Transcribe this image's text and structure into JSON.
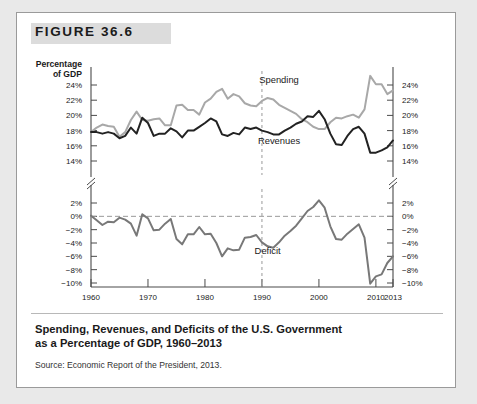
{
  "figure": {
    "label": "FIGURE 36.6",
    "caption_line1": "Spending, Revenues, and Deficits of the U.S. Government",
    "caption_line2": "as a Percentage of GDP, 1960–2013",
    "source": "Source: Economic Report of the President, 2013."
  },
  "colors": {
    "page_background": "#e9e9e9",
    "card_background": "#ffffff",
    "band": "#dcdcdc",
    "axis": "#4a4a4a",
    "spending_line": "#a8a8a8",
    "revenues_line": "#222222",
    "deficit_line": "#787878",
    "dashed_guide": "#999999",
    "text": "#1a1a1a"
  },
  "chart_data": {
    "type": "line",
    "title": "Spending, Revenues, and Deficits of the U.S. Government as a Percentage of GDP, 1960–2013",
    "xlabel": "Year",
    "ylabel": "Percentage of GDP",
    "xlim": [
      1960,
      2013
    ],
    "grid": false,
    "legend": "inline-labels",
    "axis_break": true,
    "x_ticks": [
      1960,
      1970,
      1980,
      1990,
      2000,
      2010,
      2013
    ],
    "upper_panel": {
      "ylabel_left": "Percentage of GDP",
      "y_ticks": [
        "24%",
        "22%",
        "20%",
        "18%",
        "16%",
        "14%"
      ],
      "y_tick_values": [
        24,
        22,
        20,
        18,
        16,
        14
      ],
      "ylim": [
        13,
        25
      ]
    },
    "lower_panel": {
      "y_ticks": [
        "2%",
        "0%",
        "−2%",
        "−4%",
        "−6%",
        "−8%",
        "−10%"
      ],
      "y_tick_values": [
        2,
        0,
        -2,
        -4,
        -6,
        -8,
        -10
      ],
      "ylim": [
        -11,
        3
      ]
    },
    "annotations": [
      {
        "text": "Spending",
        "x": 1993,
        "y": 24.3
      },
      {
        "text": "Revenues",
        "x": 1993,
        "y": 16.2
      },
      {
        "text": "Deficit",
        "x": 1991,
        "y": -5.6
      },
      {
        "text": "Year",
        "x": 2011,
        "y": null
      }
    ],
    "x": [
      1960,
      1961,
      1962,
      1963,
      1964,
      1965,
      1966,
      1967,
      1968,
      1969,
      1970,
      1971,
      1972,
      1973,
      1974,
      1975,
      1976,
      1977,
      1978,
      1979,
      1980,
      1981,
      1982,
      1983,
      1984,
      1985,
      1986,
      1987,
      1988,
      1989,
      1990,
      1991,
      1992,
      1993,
      1994,
      1995,
      1996,
      1997,
      1998,
      1999,
      2000,
      2001,
      2002,
      2003,
      2004,
      2005,
      2006,
      2007,
      2008,
      2009,
      2010,
      2011,
      2012,
      2013
    ],
    "series": [
      {
        "name": "Spending",
        "color": "#a8a8a8",
        "panel": "upper",
        "values": [
          17.8,
          18.4,
          18.8,
          18.6,
          18.5,
          17.2,
          17.8,
          19.4,
          20.5,
          19.4,
          19.3,
          19.5,
          19.6,
          18.7,
          18.7,
          21.3,
          21.4,
          20.7,
          20.7,
          20.1,
          21.7,
          22.2,
          23.1,
          23.5,
          22.2,
          22.8,
          22.5,
          21.6,
          21.3,
          21.2,
          21.9,
          22.3,
          22.1,
          21.4,
          21.0,
          20.6,
          20.2,
          19.5,
          19.1,
          18.5,
          18.2,
          18.2,
          19.1,
          19.7,
          19.6,
          19.9,
          20.1,
          19.7,
          20.8,
          25.2,
          24.1,
          24.1,
          22.8,
          23.3
        ]
      },
      {
        "name": "Revenues",
        "color": "#222222",
        "panel": "upper",
        "values": [
          17.8,
          17.8,
          17.6,
          17.8,
          17.6,
          17.0,
          17.3,
          18.4,
          17.6,
          19.7,
          19.0,
          17.3,
          17.6,
          17.6,
          18.3,
          17.9,
          17.1,
          18.0,
          18.0,
          18.5,
          19.0,
          19.6,
          19.2,
          17.5,
          17.3,
          17.7,
          17.5,
          18.4,
          18.2,
          18.4,
          18.0,
          17.8,
          17.5,
          17.5,
          18.0,
          18.4,
          18.9,
          19.2,
          19.9,
          19.8,
          20.6,
          19.5,
          17.6,
          16.2,
          16.1,
          17.3,
          18.2,
          18.5,
          17.6,
          15.1,
          15.1,
          15.4,
          15.8,
          16.7
        ]
      },
      {
        "name": "Deficit",
        "color": "#787878",
        "panel": "lower",
        "values": [
          0.1,
          -0.6,
          -1.3,
          -0.8,
          -0.9,
          -0.2,
          -0.5,
          -1.1,
          -2.9,
          0.3,
          -0.3,
          -2.1,
          -2.0,
          -1.1,
          -0.4,
          -3.4,
          -4.2,
          -2.7,
          -2.7,
          -1.6,
          -2.7,
          -2.6,
          -4.0,
          -6.0,
          -4.8,
          -5.1,
          -5.0,
          -3.2,
          -3.1,
          -2.8,
          -3.9,
          -4.5,
          -4.7,
          -3.9,
          -2.9,
          -2.2,
          -1.4,
          -0.3,
          0.8,
          1.4,
          2.4,
          1.3,
          -1.5,
          -3.4,
          -3.5,
          -2.6,
          -1.9,
          -1.2,
          -3.2,
          -10.1,
          -9.0,
          -8.7,
          -7.0,
          -6.0
        ]
      }
    ]
  }
}
